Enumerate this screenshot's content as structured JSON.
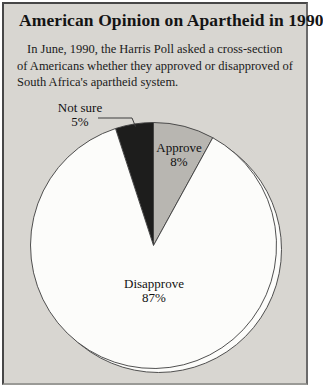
{
  "page": {
    "title": "American Opinion on Apartheid in 1990",
    "description_lines": [
      "In June, 1990, the Harris Poll asked a cross-section",
      "of Americans whether they approved or disapproved of",
      "South Africa's apartheid system."
    ]
  },
  "chart_data": {
    "type": "pie",
    "title": "American Opinion on Apartheid in 1990",
    "units": "percent",
    "legend": "none",
    "start_angle_deg": -18,
    "slices": [
      {
        "label": "Not sure",
        "value": 5,
        "value_label": "5%",
        "color": "#1d1d1c",
        "label_placement": "outside-left-with-leader"
      },
      {
        "label": "Approve",
        "value": 8,
        "value_label": "8%",
        "color": "#b8b6b1",
        "label_placement": "inside"
      },
      {
        "label": "Disapprove",
        "value": 87,
        "value_label": "87%",
        "color": "#fcfcfa",
        "label_placement": "inside"
      }
    ]
  },
  "colors": {
    "page_bg": "#ffffff",
    "card_bg": "#d8d6d1",
    "stroke": "#3d3d3d",
    "text": "#141414"
  }
}
